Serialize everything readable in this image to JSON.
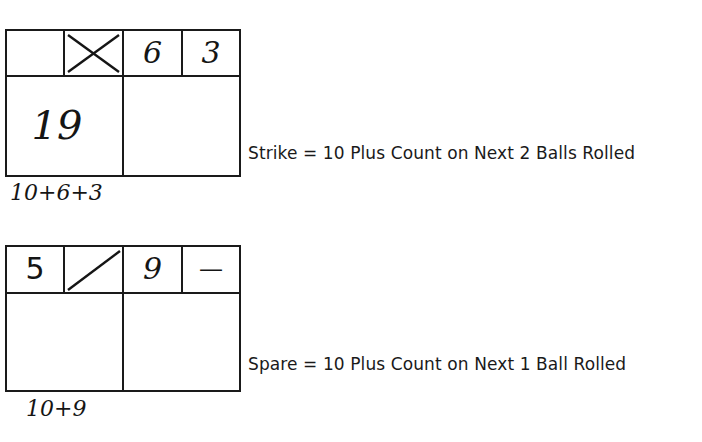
{
  "examples": [
    {
      "type": "strike",
      "frame1": {
        "ball1": "",
        "ball2_mark": "strike-x",
        "score": "19"
      },
      "frame2": {
        "ball1": "6",
        "ball2": "3",
        "score": ""
      },
      "calculation": "10+6+3",
      "rule": "Strike = 10 Plus Count on Next 2 Balls Rolled"
    },
    {
      "type": "spare",
      "frame1": {
        "ball1": "5",
        "ball2_mark": "spare-slash",
        "score": ""
      },
      "frame2": {
        "ball1": "9",
        "ball2": "—",
        "score": ""
      },
      "calculation": "10+9",
      "rule": "Spare = 10 Plus Count on Next 1 Ball Rolled"
    }
  ]
}
